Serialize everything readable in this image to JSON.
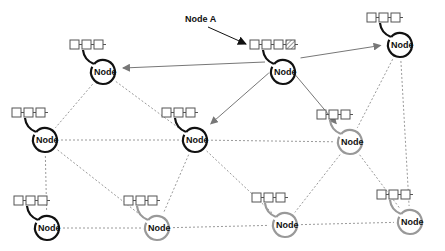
{
  "diagram": {
    "title_annotation": "Node A",
    "node_label": "Node",
    "colors": {
      "active": "#111111",
      "inactive": "#999999",
      "edge_dashed": "#9a9a9a",
      "edge_arrow": "#777777",
      "block_stroke": "#555555"
    },
    "nodes": [
      {
        "id": "n1",
        "label": "Node",
        "state": "active",
        "blocks": 3,
        "cx": 103,
        "cy": 72
      },
      {
        "id": "nodeA",
        "label": "Node",
        "state": "active",
        "blocks": 4,
        "pending_block": true,
        "cx": 283,
        "cy": 72
      },
      {
        "id": "n3",
        "label": "Node",
        "state": "active",
        "blocks": 3,
        "cx": 400,
        "cy": 45
      },
      {
        "id": "n4",
        "label": "Node",
        "state": "active",
        "blocks": 3,
        "cx": 45,
        "cy": 140
      },
      {
        "id": "n5",
        "label": "Node",
        "state": "active",
        "blocks": 3,
        "cx": 195,
        "cy": 140
      },
      {
        "id": "n6",
        "label": "Node",
        "state": "inactive",
        "blocks": 3,
        "cx": 350,
        "cy": 142
      },
      {
        "id": "n7",
        "label": "Node",
        "state": "active",
        "blocks": 3,
        "cx": 47,
        "cy": 228
      },
      {
        "id": "n8",
        "label": "Node",
        "state": "inactive",
        "blocks": 3,
        "cx": 157,
        "cy": 228
      },
      {
        "id": "n9",
        "label": "Node",
        "state": "inactive",
        "blocks": 3,
        "cx": 285,
        "cy": 225
      },
      {
        "id": "n10",
        "label": "Node",
        "state": "inactive",
        "blocks": 3,
        "cx": 410,
        "cy": 222
      }
    ],
    "arrows": [
      {
        "from": "nodeA",
        "to": "n1"
      },
      {
        "from": "nodeA",
        "to": "n3"
      },
      {
        "from": "nodeA",
        "to": "n5"
      },
      {
        "from": "nodeA",
        "to": "n6"
      }
    ],
    "dashed_edges": [
      [
        "n1",
        "n4"
      ],
      [
        "n1",
        "n5"
      ],
      [
        "n3",
        "n6"
      ],
      [
        "n3",
        "n10"
      ],
      [
        "n4",
        "n5"
      ],
      [
        "n4",
        "n7"
      ],
      [
        "n4",
        "n8"
      ],
      [
        "n5",
        "n6"
      ],
      [
        "n5",
        "n8"
      ],
      [
        "n5",
        "n9"
      ],
      [
        "n6",
        "n9"
      ],
      [
        "n6",
        "n10"
      ],
      [
        "n7",
        "n8"
      ],
      [
        "n8",
        "n9"
      ],
      [
        "n9",
        "n10"
      ]
    ]
  }
}
